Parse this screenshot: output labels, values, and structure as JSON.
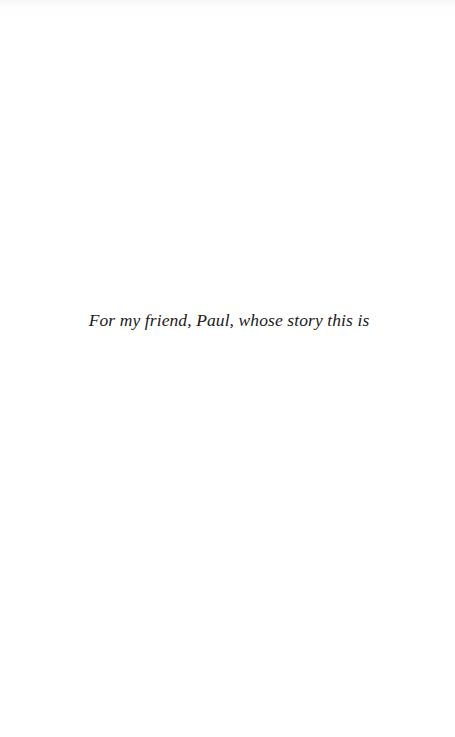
{
  "page": {
    "background": "#ffffff",
    "dedication": "For my friend, Paul, whose story this is"
  }
}
